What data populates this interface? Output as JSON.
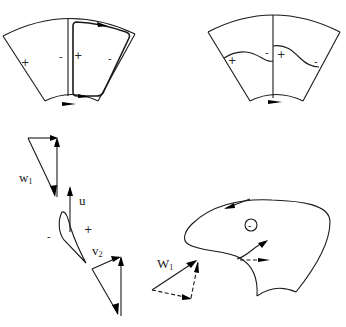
{
  "figure": {
    "panels": [
      {
        "id": "top-left",
        "description": "Blade passage sector with relative circulation loop",
        "signs": [
          "+",
          "-",
          "+",
          "-"
        ]
      },
      {
        "id": "top-right",
        "description": "Blade passage sector with pressure distribution curves",
        "signs": [
          "+",
          "-",
          "+",
          "-"
        ]
      },
      {
        "id": "bottom-left",
        "description": "Blade profile with inlet and outlet velocity triangles",
        "labels": {
          "w1_main": "w",
          "w1_sub": "1",
          "u": "u",
          "v2_main": "v",
          "v2_sub": "2",
          "minus": "-",
          "plus": "+"
        }
      },
      {
        "id": "bottom-right",
        "description": "Impeller channel with recirculation and inlet velocity triangle",
        "labels": {
          "w1_main": "W",
          "w1_sub": "1",
          "circle_sign": "-"
        }
      }
    ]
  }
}
